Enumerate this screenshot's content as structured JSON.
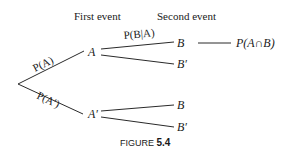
{
  "diagram": {
    "type": "probability-tree",
    "headers": {
      "first_event": "First event",
      "second_event": "Second event"
    },
    "nodes": {
      "A": "A",
      "A_prime": "A′",
      "B_upper": "B",
      "B_prime_upper": "B′",
      "B_lower": "B",
      "B_prime_lower": "B′"
    },
    "edge_labels": {
      "root_to_A": "P(A)",
      "root_to_A_prime": "P(A′)",
      "A_to_B": "P(B|A)"
    },
    "result": "P(A∩B)",
    "caption": {
      "prefix": "FIGURE ",
      "number": "5.4"
    }
  }
}
